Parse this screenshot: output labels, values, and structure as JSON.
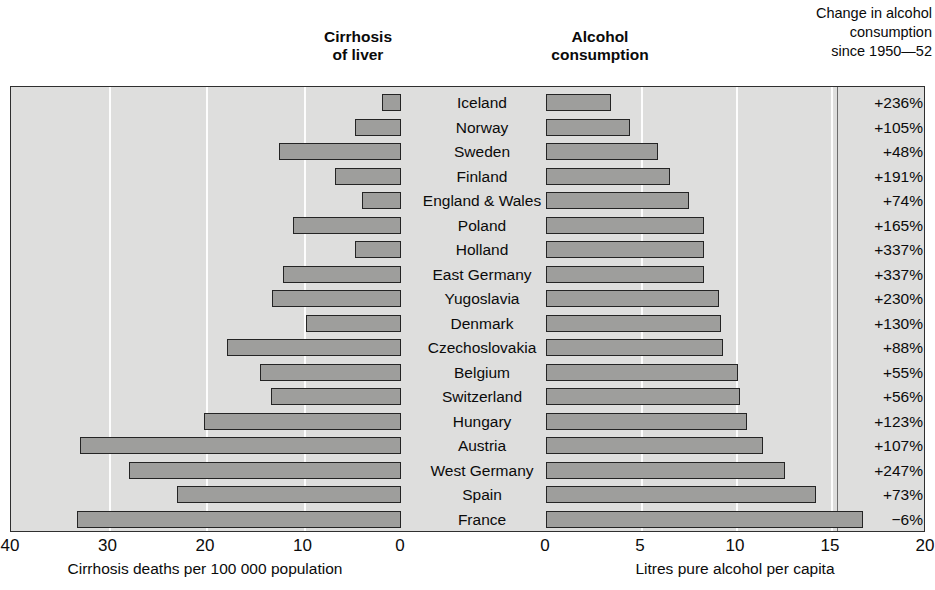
{
  "headers": {
    "left_panel": "Cirrhosis\nof liver",
    "right_panel": "Alcohol\nconsumption",
    "change_column": "Change in alcohol\nconsumption\nsince 1950—52"
  },
  "axes": {
    "left": {
      "title": "Cirrhosis deaths per 100 000 population",
      "ticks": [
        "40",
        "30",
        "20",
        "10",
        "0"
      ],
      "range": [
        40,
        0
      ]
    },
    "right": {
      "title": "Litres pure alcohol per capita",
      "ticks": [
        "0",
        "5",
        "10",
        "15",
        "20"
      ],
      "range": [
        0,
        20
      ]
    }
  },
  "colors": {
    "bar_fill": "#9e9e9c",
    "bar_stroke": "#242424",
    "plot_background": "#dededd",
    "gridline": "#fdfdfd",
    "frame": "#2f2f2f"
  },
  "chart_data": {
    "type": "bar",
    "orientation": "horizontal-bidirectional",
    "categories": [
      "Iceland",
      "Norway",
      "Sweden",
      "Finland",
      "England & Wales",
      "Poland",
      "Holland",
      "East Germany",
      "Yugoslavia",
      "Denmark",
      "Czechoslovakia",
      "Belgium",
      "Switzerland",
      "Hungary",
      "Austria",
      "West Germany",
      "Spain",
      "France"
    ],
    "series": [
      {
        "name": "Cirrhosis of liver",
        "unit": "Cirrhosis deaths per 100 000 population",
        "axis": "left",
        "xlabel": "Cirrhosis deaths per 100 000 population",
        "xlim": [
          40,
          0
        ],
        "values": [
          2.0,
          4.7,
          12.5,
          6.8,
          4.0,
          11.1,
          4.7,
          12.1,
          13.2,
          9.7,
          17.8,
          14.5,
          13.3,
          20.2,
          32.9,
          27.9,
          23.0,
          33.2
        ]
      },
      {
        "name": "Alcohol consumption",
        "unit": "Litres pure alcohol per capita",
        "axis": "right",
        "xlabel": "Litres pure alcohol per capita",
        "xlim": [
          0,
          20
        ],
        "values": [
          3.4,
          4.4,
          5.9,
          6.5,
          7.5,
          8.3,
          8.3,
          8.3,
          9.1,
          9.2,
          9.3,
          10.1,
          10.2,
          10.6,
          11.4,
          12.6,
          14.2,
          16.7
        ]
      }
    ],
    "annotations": {
      "label": "Change in alcohol consumption since 1950—52",
      "values": [
        "+236%",
        "+105%",
        "+48%",
        "+191%",
        "+74%",
        "+165%",
        "+337%",
        "+337%",
        "+230%",
        "+130%",
        "+88%",
        "+55%",
        "+56%",
        "+123%",
        "+107%",
        "+247%",
        "+73%",
        "−6%"
      ]
    },
    "grid": true,
    "legend": "none"
  }
}
